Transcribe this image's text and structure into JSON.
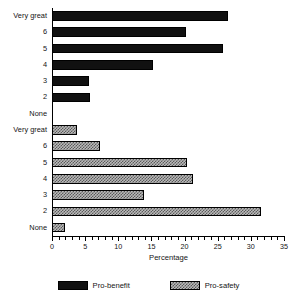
{
  "chart_data": {
    "type": "bar",
    "orientation": "horizontal",
    "title": "",
    "xlabel": "Percentage",
    "ylabel": "",
    "xlim": [
      0,
      35
    ],
    "xticks": [
      0,
      5,
      10,
      15,
      20,
      25,
      30,
      35
    ],
    "xtick_labels": [
      "0",
      "5",
      "10",
      "15",
      "20",
      "25",
      "30",
      "35"
    ],
    "minor_tick_step": 1,
    "grid": false,
    "legend_position": "bottom-center",
    "categories": [
      "Very great",
      "6",
      "5",
      "4",
      "3",
      "2",
      "None"
    ],
    "series": [
      {
        "name": "Pro-benefit",
        "fill": "solid-black",
        "color": "#111111",
        "values": [
          26.5,
          20.2,
          25.8,
          15.2,
          5.6,
          5.8,
          0.0
        ]
      },
      {
        "name": "Pro-safety",
        "fill": "hatched-gray",
        "color": "#b9b9b9",
        "values": [
          3.7,
          7.3,
          20.4,
          21.3,
          13.9,
          31.6,
          1.9
        ]
      }
    ],
    "rows": [
      {
        "group": "Pro-benefit",
        "label": "Very great",
        "value": 26.5
      },
      {
        "group": "Pro-benefit",
        "label": "6",
        "value": 20.2
      },
      {
        "group": "Pro-benefit",
        "label": "5",
        "value": 25.8
      },
      {
        "group": "Pro-benefit",
        "label": "4",
        "value": 15.2
      },
      {
        "group": "Pro-benefit",
        "label": "3",
        "value": 5.6
      },
      {
        "group": "Pro-benefit",
        "label": "2",
        "value": 5.8
      },
      {
        "group": "Pro-benefit",
        "label": "None",
        "value": 0.0
      },
      {
        "group": "Pro-safety",
        "label": "Very great",
        "value": 3.7
      },
      {
        "group": "Pro-safety",
        "label": "6",
        "value": 7.3
      },
      {
        "group": "Pro-safety",
        "label": "5",
        "value": 20.4
      },
      {
        "group": "Pro-safety",
        "label": "4",
        "value": 21.3
      },
      {
        "group": "Pro-safety",
        "label": "3",
        "value": 13.9
      },
      {
        "group": "Pro-safety",
        "label": "2",
        "value": 31.6
      },
      {
        "group": "Pro-safety",
        "label": "None",
        "value": 1.9
      }
    ]
  },
  "axis": {
    "x_title": "Percentage"
  },
  "legend": {
    "items": [
      {
        "label": "Pro-benefit",
        "fill": "solid-black"
      },
      {
        "label": "Pro-safety",
        "fill": "hatched-gray"
      }
    ]
  }
}
